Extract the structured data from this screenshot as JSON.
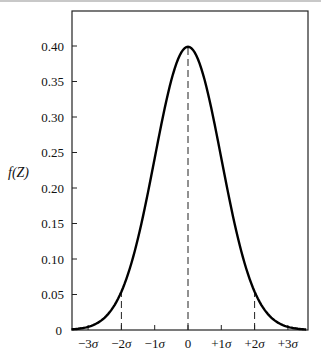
{
  "chart_data": {
    "type": "line",
    "title": "",
    "xlabel": "",
    "ylabel": "f(Z)",
    "x_tick_labels": [
      "−3σ",
      "−2σ",
      "−1σ",
      "0",
      "+1σ",
      "+2σ",
      "+3σ"
    ],
    "x_ticks": [
      -3,
      -2,
      -1,
      0,
      1,
      2,
      3
    ],
    "y_tick_labels": [
      "0",
      "0.05",
      "0.10",
      "0.15",
      "0.20",
      "0.25",
      "0.30",
      "0.35",
      "0.40"
    ],
    "y_ticks": [
      0,
      0.05,
      0.1,
      0.15,
      0.2,
      0.25,
      0.3,
      0.35,
      0.4
    ],
    "xlim": [
      -3.5,
      3.6
    ],
    "ylim": [
      0,
      0.44
    ],
    "grid": false,
    "legend": null,
    "series": [
      {
        "name": "Standard normal density f(Z)",
        "x": [
          -3.5,
          -3.0,
          -2.5,
          -2.0,
          -1.5,
          -1.0,
          -0.5,
          0.0,
          0.5,
          1.0,
          1.5,
          2.0,
          2.5,
          3.0,
          3.5
        ],
        "values": [
          0.0009,
          0.0044,
          0.0175,
          0.054,
          0.1295,
          0.242,
          0.3521,
          0.3989,
          0.3521,
          0.242,
          0.1295,
          0.054,
          0.0175,
          0.0044,
          0.0009
        ]
      }
    ],
    "annotations": [
      {
        "type": "dashed-vertical",
        "x": -2,
        "y_top": 0.054
      },
      {
        "type": "dashed-vertical",
        "x": 0,
        "y_top": 0.3989
      },
      {
        "type": "dashed-vertical",
        "x": 2,
        "y_top": 0.054
      }
    ]
  },
  "labels": {
    "ylabel": "f(Z)"
  }
}
